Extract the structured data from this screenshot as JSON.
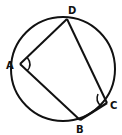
{
  "diagram": {
    "type": "cyclic-quadrilateral",
    "colors": {
      "stroke": "#111111",
      "background": "#ffffff"
    },
    "circle": {
      "cx": 63,
      "cy": 69,
      "r": 52
    },
    "vertices": {
      "A": {
        "label": "A",
        "x": 20,
        "y": 64,
        "label_x": 6,
        "label_y": 69
      },
      "B": {
        "label": "B",
        "x": 80,
        "y": 120,
        "label_x": 76,
        "label_y": 133
      },
      "C": {
        "label": "C",
        "x": 107,
        "y": 103,
        "label_x": 110,
        "label_y": 109
      },
      "D": {
        "label": "D",
        "x": 67,
        "y": 19,
        "label_x": 68,
        "label_y": 14
      }
    },
    "edges": [
      "AD",
      "DC",
      "CB",
      "BA"
    ],
    "marked_angles": [
      "A",
      "C"
    ]
  }
}
